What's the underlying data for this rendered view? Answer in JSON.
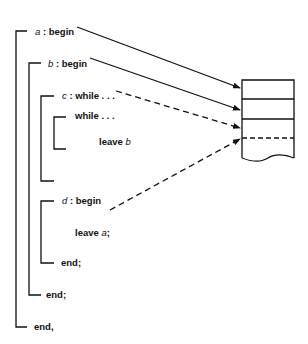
{
  "blocks": [
    {
      "id": "a",
      "name": "a",
      "sep": " : ",
      "keyword": "begin",
      "end": "end,"
    },
    {
      "id": "b",
      "name": "b",
      "sep": " : ",
      "keyword": "begin",
      "end": "end;"
    },
    {
      "id": "c",
      "name": "c",
      "sep": " : ",
      "keyword": "while . . ."
    },
    {
      "id": "inner",
      "keyword": "while . . ."
    },
    {
      "id": "d",
      "name": "d",
      "sep": " : ",
      "keyword": "begin",
      "end": "end;"
    }
  ],
  "statements": {
    "leave_b": {
      "keyword": "leave",
      "target": "b"
    },
    "leave_a": {
      "keyword": "leave",
      "target": "a",
      "suffix": ";"
    }
  },
  "stack": {
    "frames": 4,
    "note": "activation stack with frames for a, b, c, d"
  },
  "arrows": [
    {
      "from": "a",
      "to": "stack-frame-1",
      "style": "solid"
    },
    {
      "from": "b",
      "to": "stack-frame-2",
      "style": "solid"
    },
    {
      "from": "c",
      "to": "stack-frame-3",
      "style": "dashed"
    },
    {
      "from": "d",
      "to": "stack-frame-4",
      "style": "dashed"
    }
  ]
}
